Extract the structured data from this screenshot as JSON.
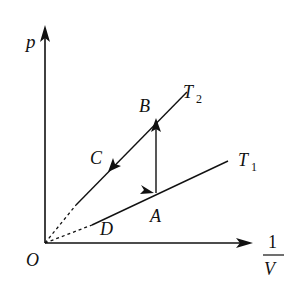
{
  "diagram": {
    "axes": {
      "y_label": "p",
      "x_label_numerator": "1",
      "x_label_denominator": "V",
      "origin_label": "O"
    },
    "isotherms": [
      {
        "name": "T",
        "subscript": "2",
        "label": "T2"
      },
      {
        "name": "T",
        "subscript": "1",
        "label": "T1"
      }
    ],
    "points": {
      "A": "A",
      "B": "B",
      "C": "C",
      "D": "D"
    },
    "process": [
      "A→B (vertical, arrow up)",
      "B→C (along T2 toward origin)",
      "D→A (along T1 away from origin)"
    ],
    "colors": {
      "line": "#111111",
      "background": "#ffffff"
    }
  }
}
